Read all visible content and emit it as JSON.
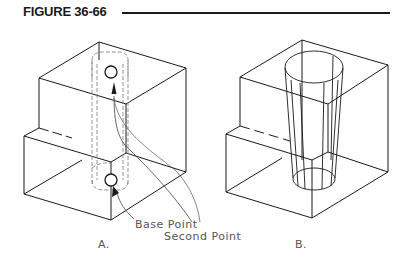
{
  "figure": {
    "title": "FIGURE 36-66"
  },
  "panels": [
    {
      "id": "A",
      "label": "A.",
      "annotations": [
        {
          "text": "Base Point"
        },
        {
          "text": "Second Point"
        }
      ],
      "description": "Stepped block with dashed hidden-line cylinder and arrow from base point circle to second point circle"
    },
    {
      "id": "B",
      "label": "B.",
      "description": "Stepped block with tapered cone-shaped hole extruded along path"
    }
  ],
  "colors": {
    "line": "#1a1a1a",
    "hidden_line": "#888888",
    "label_text": "#555555"
  }
}
